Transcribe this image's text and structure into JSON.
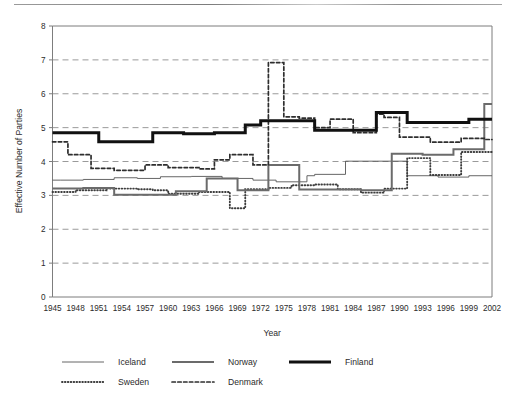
{
  "chart_data": {
    "type": "line",
    "title": "",
    "xlabel": "Year",
    "ylabel": "Effective Number of Parties",
    "xlim": [
      1945,
      2002
    ],
    "ylim": [
      0,
      8
    ],
    "yticks": [
      0,
      1,
      2,
      3,
      4,
      5,
      6,
      7,
      8
    ],
    "xticks": [
      1945,
      1948,
      1951,
      1954,
      1957,
      1960,
      1963,
      1966,
      1969,
      1972,
      1975,
      1978,
      1981,
      1984,
      1987,
      1990,
      1993,
      1996,
      1999,
      2002
    ],
    "grid": "horizontal-dashed",
    "legend_position": "below",
    "legend": [
      "Iceland",
      "Sweden",
      "Norway",
      "Denmark",
      "Finland"
    ],
    "series": [
      {
        "name": "Iceland",
        "style": "thin-solid",
        "color": "#555555",
        "x": [
          1945,
          1946,
          1949,
          1953,
          1956,
          1959,
          1963,
          1967,
          1971,
          1974,
          1978,
          1979,
          1983,
          1987,
          1991,
          1995,
          1999,
          2002
        ],
        "values": [
          3.45,
          3.45,
          3.47,
          3.52,
          3.5,
          3.55,
          3.56,
          3.5,
          3.45,
          3.4,
          3.58,
          3.62,
          4.01,
          4.01,
          3.58,
          3.54,
          3.58,
          3.58
        ]
      },
      {
        "name": "Sweden",
        "style": "fine-dotted",
        "color": "#3d3d3d",
        "x": [
          1945,
          1948,
          1952,
          1956,
          1958,
          1960,
          1964,
          1968,
          1970,
          1973,
          1976,
          1979,
          1982,
          1985,
          1988,
          1991,
          1994,
          1998,
          2002
        ],
        "values": [
          3.1,
          3.15,
          3.2,
          3.18,
          3.15,
          3.05,
          3.1,
          2.62,
          3.18,
          3.22,
          3.3,
          3.32,
          3.18,
          3.08,
          3.2,
          4.1,
          3.6,
          4.28,
          4.3
        ]
      },
      {
        "name": "Norway",
        "style": "medium-solid",
        "color": "#6b6b6b",
        "x": [
          1945,
          1949,
          1953,
          1957,
          1961,
          1965,
          1969,
          1973,
          1977,
          1981,
          1985,
          1989,
          1993,
          1997,
          2001,
          2002
        ],
        "values": [
          3.2,
          3.22,
          3.02,
          3.02,
          3.12,
          3.5,
          3.15,
          3.9,
          3.17,
          3.17,
          3.15,
          4.23,
          4.2,
          4.36,
          5.7,
          5.7
        ]
      },
      {
        "name": "Denmark",
        "style": "dashed",
        "color": "#2e2e2e",
        "x": [
          1945,
          1947,
          1950,
          1953,
          1957,
          1960,
          1964,
          1966,
          1968,
          1971,
          1973,
          1975,
          1977,
          1979,
          1981,
          1984,
          1987,
          1988,
          1990,
          1994,
          1998,
          2001,
          2002
        ],
        "values": [
          4.58,
          4.2,
          3.8,
          3.74,
          3.9,
          3.82,
          3.78,
          4.05,
          4.2,
          3.9,
          6.92,
          5.32,
          5.28,
          5.0,
          5.25,
          4.85,
          5.4,
          5.3,
          4.72,
          4.57,
          4.68,
          4.65,
          4.65
        ]
      },
      {
        "name": "Finland",
        "style": "thick-solid",
        "color": "#111111",
        "x": [
          1945,
          1948,
          1951,
          1954,
          1958,
          1962,
          1966,
          1970,
          1972,
          1975,
          1979,
          1983,
          1987,
          1991,
          1995,
          1999,
          2002
        ],
        "values": [
          4.85,
          4.85,
          4.58,
          4.58,
          4.85,
          4.82,
          4.85,
          5.08,
          5.2,
          5.2,
          4.92,
          4.92,
          5.45,
          5.15,
          5.15,
          5.25,
          5.25
        ]
      }
    ]
  },
  "axes": {
    "y_title": "Effective Number of Parties",
    "x_title": "Year",
    "y_tick_labels": [
      "8",
      "7",
      "6",
      "5",
      "4",
      "3",
      "2",
      "1",
      "0"
    ],
    "x_tick_labels": [
      "1945",
      "1948",
      "1951",
      "1954",
      "1957",
      "1960",
      "1963",
      "1966",
      "1969",
      "1972",
      "1975",
      "1978",
      "1981",
      "1984",
      "1987",
      "1990",
      "1993",
      "1996",
      "1999",
      "2002"
    ]
  },
  "legend": {
    "items": [
      {
        "label": "Iceland",
        "swatch": "thin-solid-swatch"
      },
      {
        "label": "Norway",
        "swatch": "medium-solid-swatch"
      },
      {
        "label": "Finland",
        "swatch": "thick-solid-swatch"
      },
      {
        "label": "Sweden",
        "swatch": "fine-dotted-swatch"
      },
      {
        "label": "Denmark",
        "swatch": "dashed-swatch"
      }
    ]
  },
  "colors": {
    "grid": "#8f8f8f",
    "frame": "#7d7d7d",
    "iceland": "#555555",
    "sweden": "#3d3d3d",
    "norway": "#6b6b6b",
    "denmark": "#2e2e2e",
    "finland": "#111111"
  }
}
